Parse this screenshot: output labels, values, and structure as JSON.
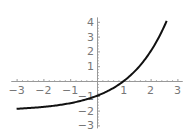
{
  "chart_data": {
    "type": "line",
    "title": "",
    "xlabel": "",
    "ylabel": "",
    "function": "y = 2^x - 2",
    "xlim": [
      -3.2,
      3.2
    ],
    "ylim": [
      -3.2,
      4.3
    ],
    "x_ticks": [
      "-3",
      "-2",
      "-1",
      "1",
      "2",
      "3"
    ],
    "y_ticks": [
      "4",
      "3",
      "2",
      "1",
      "-1",
      "-2",
      "-3"
    ],
    "grid": false,
    "series": [
      {
        "name": "curve",
        "x": [
          -3,
          -2.5,
          -2,
          -1.5,
          -1,
          -0.5,
          0,
          0.5,
          1,
          1.5,
          2,
          2.3,
          2.6
        ],
        "y": [
          -1.875,
          -1.823,
          -1.75,
          -1.646,
          -1.5,
          -1.293,
          -1,
          -0.586,
          0,
          0.828,
          2,
          2.925,
          4.063
        ]
      }
    ],
    "color": "#111111",
    "axis_color": "#999999"
  }
}
